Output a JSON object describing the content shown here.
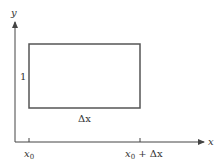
{
  "diagram": {
    "type": "rectangle-on-axes",
    "colors": {
      "axis": "#444444",
      "rectangle": "#555555",
      "text": "#333333",
      "background": "#ffffff"
    },
    "axes": {
      "x_label": "x",
      "y_label": "y"
    },
    "rectangle": {
      "height_label": "1",
      "width_label": "Δx"
    },
    "ticks": [
      {
        "base": "x",
        "sub": "0",
        "suffix": ""
      },
      {
        "base": "x",
        "sub": "0",
        "suffix": " + Δx"
      }
    ]
  }
}
